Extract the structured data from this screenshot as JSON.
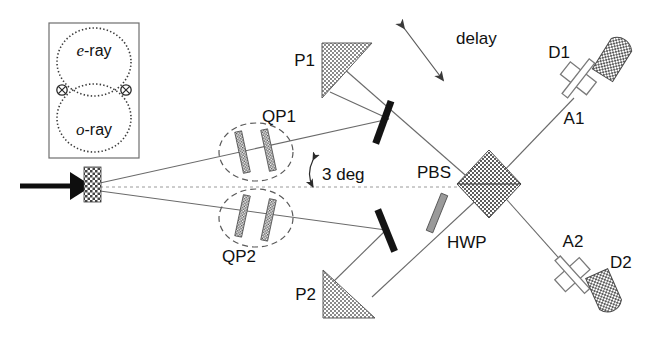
{
  "figure": {
    "background": "#ffffff",
    "ink": "#111111",
    "beam_color": "#6a6a6a",
    "hatch_color": "#8c8c8c",
    "mirror_color": "#1a1a1a"
  },
  "inset": {
    "name": "emission-cone-inset",
    "e_ray_label": "e-ray",
    "o_ray_label": "o-ray",
    "e_ray_italic_prefix": "e",
    "o_ray_italic_prefix": "o",
    "ray_suffix": "-ray",
    "intersection_marker": "crossed-circle",
    "marker_count": 2,
    "border_color": "#6e6e6e"
  },
  "components": {
    "pump": {
      "label": "",
      "icon": "pump-beam-arrow"
    },
    "crystal": {
      "label": "",
      "icon": "bbo-crystal-block"
    },
    "qp1": {
      "label": "QP1",
      "plates": 2,
      "icon": "quartz-plate-pair"
    },
    "qp2": {
      "label": "QP2",
      "plates": 2,
      "icon": "quartz-plate-pair"
    },
    "p1": {
      "label": "P1",
      "icon": "prism-triangle"
    },
    "p2": {
      "label": "P2",
      "icon": "prism-triangle"
    },
    "m1": {
      "label": "",
      "icon": "mirror-bar"
    },
    "m2": {
      "label": "",
      "icon": "mirror-bar"
    },
    "pbs": {
      "label": "PBS",
      "icon": "polarizing-beam-splitter-cube"
    },
    "hwp": {
      "label": "HWP",
      "icon": "half-wave-plate"
    },
    "a1": {
      "label": "A1",
      "icon": "analyzer-plate"
    },
    "a2": {
      "label": "A2",
      "icon": "analyzer-plate"
    },
    "d1": {
      "label": "D1",
      "icon": "detector-dome"
    },
    "d2": {
      "label": "D2",
      "icon": "detector-dome"
    },
    "delay": {
      "label": "delay",
      "icon": "double-arrow"
    },
    "angle": {
      "label": "3 deg",
      "value": 3,
      "unit": "deg",
      "icon": "angle-arc"
    }
  }
}
